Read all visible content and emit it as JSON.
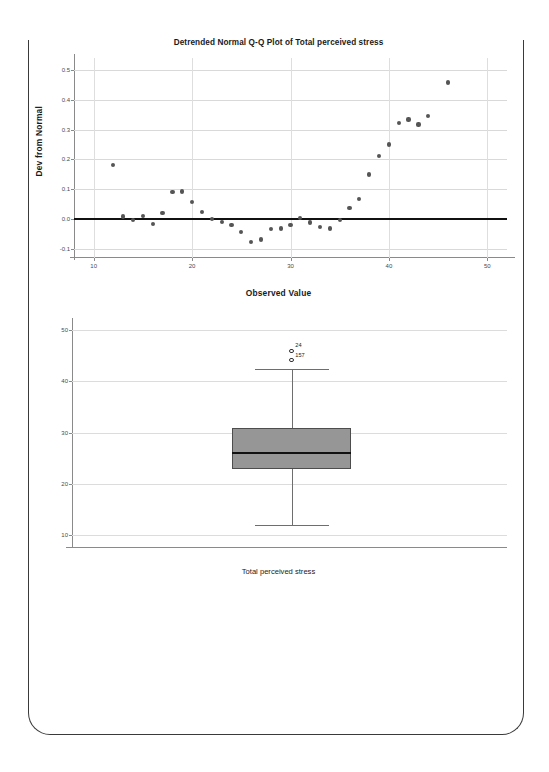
{
  "page": {
    "background_color": "#ffffff",
    "sheet_border_color": "#3a3a3a"
  },
  "chart_data": [
    {
      "id": "detrended-qq-plot",
      "type": "scatter",
      "title": "Detrended Normal Q-Q Plot of Total perceived stress",
      "xlabel": "Observed Value",
      "ylabel": "Dev from Normal",
      "xlim": [
        8,
        52
      ],
      "ylim": [
        -0.13,
        0.54
      ],
      "xticks": [
        10,
        20,
        30,
        40,
        50
      ],
      "xtick_labels": [
        "10",
        "20",
        "30",
        "40",
        "50"
      ],
      "yticks": [
        -0.1,
        0.0,
        0.1,
        0.2,
        0.3,
        0.4,
        0.5
      ],
      "ytick_labels": [
        "-0.1",
        "0.0",
        "0.1",
        "0.2",
        "0.3",
        "0.4",
        "0.5"
      ],
      "grid": true,
      "legend": "none",
      "reference_line": {
        "y": 0.0,
        "color": "#111111"
      },
      "marker_color": "#555555",
      "points": [
        {
          "x": 12.0,
          "y": 0.182
        },
        {
          "x": 13.0,
          "y": 0.009
        },
        {
          "x": 14.0,
          "y": -0.004
        },
        {
          "x": 15.0,
          "y": 0.01
        },
        {
          "x": 16.0,
          "y": -0.016
        },
        {
          "x": 17.0,
          "y": 0.021
        },
        {
          "x": 18.0,
          "y": 0.09
        },
        {
          "x": 19.0,
          "y": 0.093
        },
        {
          "x": 20.0,
          "y": 0.058
        },
        {
          "x": 21.0,
          "y": 0.023
        },
        {
          "x": 22.0,
          "y": 0.002
        },
        {
          "x": 23.0,
          "y": -0.01
        },
        {
          "x": 24.0,
          "y": -0.019
        },
        {
          "x": 25.0,
          "y": -0.042
        },
        {
          "x": 26.0,
          "y": -0.077
        },
        {
          "x": 27.0,
          "y": -0.068
        },
        {
          "x": 28.0,
          "y": -0.034
        },
        {
          "x": 29.0,
          "y": -0.031
        },
        {
          "x": 30.0,
          "y": -0.019
        },
        {
          "x": 31.0,
          "y": 0.003
        },
        {
          "x": 32.0,
          "y": -0.011
        },
        {
          "x": 33.0,
          "y": -0.026
        },
        {
          "x": 34.0,
          "y": -0.031
        },
        {
          "x": 35.0,
          "y": -0.004
        },
        {
          "x": 36.0,
          "y": 0.038
        },
        {
          "x": 37.0,
          "y": 0.068
        },
        {
          "x": 38.0,
          "y": 0.15
        },
        {
          "x": 39.0,
          "y": 0.213
        },
        {
          "x": 40.0,
          "y": 0.25
        },
        {
          "x": 41.0,
          "y": 0.323
        },
        {
          "x": 42.0,
          "y": 0.334
        },
        {
          "x": 43.0,
          "y": 0.317
        },
        {
          "x": 44.0,
          "y": 0.345
        },
        {
          "x": 46.0,
          "y": 0.458
        }
      ]
    },
    {
      "id": "boxplot-total-perceived-stress",
      "type": "box",
      "title": "",
      "xlabel": "Total perceived stress",
      "ylabel": "",
      "ylim": [
        7.5,
        52
      ],
      "yticks": [
        10,
        20,
        30,
        40,
        50
      ],
      "ytick_labels": [
        "10",
        "20",
        "30",
        "40",
        "50"
      ],
      "grid": true,
      "legend": "none",
      "box_fill_color": "#969696",
      "box_border_color": "#4d4d4d",
      "categories": [
        "Total perceived stress"
      ],
      "boxes": [
        {
          "category": "Total perceived stress",
          "whisker_low": 12.0,
          "q1": 23.0,
          "median": 26.0,
          "q3": 31.0,
          "whisker_high": 42.5,
          "outliers": [
            {
              "label": "24",
              "value": 46.0
            },
            {
              "label": "157",
              "value": 44.2
            }
          ]
        }
      ]
    }
  ]
}
